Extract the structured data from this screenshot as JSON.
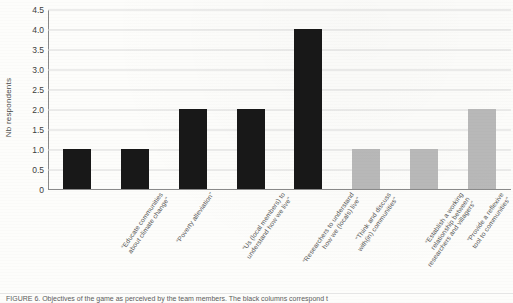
{
  "chart_data": {
    "type": "bar",
    "title": "",
    "xlabel": "",
    "ylabel": "Nb respondents",
    "ylim": [
      0,
      4.5
    ],
    "grid": true,
    "legend_position": "none",
    "ytick_labels": [
      "4.5",
      "4.0",
      "3.5",
      "3.0",
      "2.5",
      "2.0",
      "1.5",
      "1.0",
      "0.5",
      "0"
    ],
    "ytick_values": [
      4.5,
      4.0,
      3.5,
      3.0,
      2.5,
      2.0,
      1.5,
      1.0,
      0.5,
      0
    ],
    "categories": [
      "“Educate communities about climate change”",
      "“Poverty alleviation”",
      "“Us (local members) to understand how we live”",
      "“Researchers to understand how we (locals) live”",
      "“Think and discuss with(in) communities”",
      "“Establish a working relationship between researchers and villagers”",
      "“Provide a reflexive tool to communities”",
      "“Research on coexistence and suggest management adjustments”"
    ],
    "category_lines": [
      [
        "“Educate communities",
        "about climate change”"
      ],
      [
        "“Poverty alleviation”",
        ""
      ],
      [
        "“Us (local members) to",
        "understand how we live”"
      ],
      [
        "“Researchers to understand",
        "how we (locals) live”"
      ],
      [
        "“Think and discuss",
        "with(in) communities”"
      ],
      [
        "“Establish a working",
        "relationship between",
        "researchers and villagers”"
      ],
      [
        "“Provide a reflexive",
        "tool to communities”"
      ],
      [
        "“Research on coexistence",
        "and suggest management",
        "adjustments”"
      ]
    ],
    "values": [
      1,
      1,
      2,
      2,
      4,
      1,
      1,
      2
    ],
    "bar_colors": [
      "#181818",
      "#181818",
      "#181818",
      "#181818",
      "#181818",
      "#b9b9b9",
      "#b9b9b9",
      "#b9b9b9"
    ],
    "series": [
      {
        "name": "Nb respondents",
        "values": [
          1,
          1,
          2,
          2,
          4,
          1,
          1,
          2
        ]
      }
    ]
  },
  "figure": {
    "caption": "FIGURE 6. Objectives of the game as perceived by the team members. The black columns correspond t"
  },
  "colors": {
    "bar_dark": "#181818",
    "bar_light": "#b9b9b9",
    "gridline": "#dcdcdc",
    "axis": "#8a8a8a",
    "text": "#555555",
    "background": "#fdfdfb"
  }
}
